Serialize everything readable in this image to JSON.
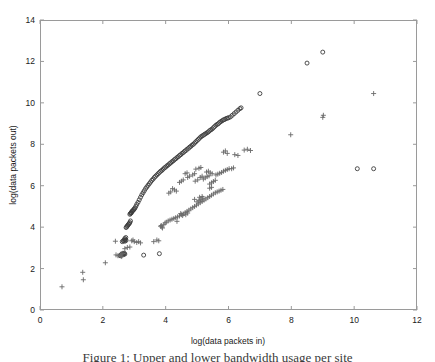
{
  "figure": {
    "caption_clipped": "Figure 1: Upper and lower bandwidth usage per site"
  },
  "chart_data": {
    "type": "scatter",
    "title": "",
    "xlabel": "log(data packets in)",
    "ylabel": "log(data packets out)",
    "xlim": [
      0,
      12
    ],
    "ylim": [
      0,
      14
    ],
    "xticks": [
      0,
      2,
      4,
      6,
      8,
      10,
      12
    ],
    "yticks": [
      0,
      2,
      4,
      6,
      8,
      10,
      12,
      14
    ],
    "grid": false,
    "legend": "none",
    "box": true,
    "tick_direction": "in",
    "axis_color": "#9a9a9a",
    "series": [
      {
        "name": "circles",
        "marker": "circle",
        "color": "#3c3c3c",
        "size": 4.0,
        "filled": false,
        "points": [
          [
            2.55,
            2.62
          ],
          [
            2.58,
            2.66
          ],
          [
            2.6,
            2.7
          ],
          [
            2.62,
            2.65
          ],
          [
            2.64,
            2.72
          ],
          [
            2.66,
            2.68
          ],
          [
            2.68,
            2.74
          ],
          [
            2.7,
            2.7
          ],
          [
            2.62,
            3.3
          ],
          [
            2.65,
            3.34
          ],
          [
            2.68,
            3.38
          ],
          [
            2.7,
            3.32
          ],
          [
            2.72,
            3.4
          ],
          [
            2.74,
            3.36
          ],
          [
            2.7,
            3.45
          ],
          [
            2.73,
            3.5
          ],
          [
            2.76,
            4.02
          ],
          [
            2.78,
            4.06
          ],
          [
            2.8,
            4.1
          ],
          [
            2.74,
            3.98
          ],
          [
            2.82,
            4.14
          ],
          [
            2.84,
            4.18
          ],
          [
            2.86,
            4.22
          ],
          [
            2.88,
            4.3
          ],
          [
            2.86,
            4.62
          ],
          [
            2.88,
            4.66
          ],
          [
            2.9,
            4.7
          ],
          [
            2.92,
            4.74
          ],
          [
            2.94,
            4.78
          ],
          [
            2.9,
            4.68
          ],
          [
            2.96,
            4.8
          ],
          [
            2.98,
            4.84
          ],
          [
            3.0,
            4.88
          ],
          [
            3.02,
            4.92
          ],
          [
            3.05,
            5.0
          ],
          [
            3.08,
            5.1
          ],
          [
            3.12,
            5.2
          ],
          [
            3.16,
            5.32
          ],
          [
            3.2,
            5.44
          ],
          [
            3.24,
            5.56
          ],
          [
            3.28,
            5.66
          ],
          [
            3.32,
            5.76
          ],
          [
            3.36,
            5.86
          ],
          [
            3.4,
            5.94
          ],
          [
            3.44,
            6.02
          ],
          [
            3.48,
            6.1
          ],
          [
            3.52,
            6.18
          ],
          [
            3.56,
            6.26
          ],
          [
            3.6,
            6.32
          ],
          [
            3.64,
            6.4
          ],
          [
            3.68,
            6.46
          ],
          [
            3.72,
            6.52
          ],
          [
            3.76,
            6.58
          ],
          [
            3.8,
            6.64
          ],
          [
            3.84,
            6.7
          ],
          [
            3.88,
            6.74
          ],
          [
            3.92,
            6.8
          ],
          [
            3.96,
            6.86
          ],
          [
            4.0,
            6.9
          ],
          [
            4.04,
            6.96
          ],
          [
            4.08,
            7.0
          ],
          [
            4.12,
            7.06
          ],
          [
            4.16,
            7.1
          ],
          [
            4.2,
            7.16
          ],
          [
            4.24,
            7.2
          ],
          [
            4.28,
            7.26
          ],
          [
            4.32,
            7.3
          ],
          [
            4.36,
            7.36
          ],
          [
            4.4,
            7.4
          ],
          [
            4.44,
            7.46
          ],
          [
            4.48,
            7.5
          ],
          [
            4.52,
            7.56
          ],
          [
            4.56,
            7.6
          ],
          [
            4.6,
            7.66
          ],
          [
            4.64,
            7.7
          ],
          [
            4.68,
            7.76
          ],
          [
            4.72,
            7.8
          ],
          [
            4.76,
            7.86
          ],
          [
            4.8,
            7.9
          ],
          [
            4.84,
            7.96
          ],
          [
            4.88,
            8.0
          ],
          [
            4.92,
            8.06
          ],
          [
            4.96,
            8.12
          ],
          [
            5.0,
            8.18
          ],
          [
            5.04,
            8.24
          ],
          [
            5.08,
            8.3
          ],
          [
            5.12,
            8.36
          ],
          [
            5.16,
            8.4
          ],
          [
            5.2,
            8.44
          ],
          [
            5.24,
            8.48
          ],
          [
            5.28,
            8.52
          ],
          [
            5.32,
            8.56
          ],
          [
            5.36,
            8.6
          ],
          [
            5.4,
            8.66
          ],
          [
            5.44,
            8.7
          ],
          [
            5.48,
            8.74
          ],
          [
            5.52,
            8.8
          ],
          [
            5.56,
            8.86
          ],
          [
            5.6,
            8.92
          ],
          [
            5.64,
            8.96
          ],
          [
            5.68,
            9.0
          ],
          [
            5.72,
            9.06
          ],
          [
            5.76,
            9.1
          ],
          [
            5.8,
            9.14
          ],
          [
            5.84,
            9.18
          ],
          [
            5.88,
            9.2
          ],
          [
            5.92,
            9.24
          ],
          [
            5.96,
            9.26
          ],
          [
            6.0,
            9.28
          ],
          [
            6.06,
            9.32
          ],
          [
            6.12,
            9.4
          ],
          [
            6.18,
            9.48
          ],
          [
            6.24,
            9.56
          ],
          [
            6.3,
            9.64
          ],
          [
            6.36,
            9.72
          ],
          [
            6.4,
            9.76
          ],
          [
            3.3,
            2.65
          ],
          [
            3.8,
            2.72
          ],
          [
            7.0,
            10.45
          ],
          [
            8.5,
            11.92
          ],
          [
            9.0,
            12.45
          ],
          [
            10.1,
            6.82
          ],
          [
            10.62,
            6.82
          ]
        ]
      },
      {
        "name": "pluses",
        "marker": "plus",
        "color": "#6a6a6a",
        "size": 5.0,
        "points": [
          [
            0.7,
            1.12
          ],
          [
            1.38,
            1.46
          ],
          [
            1.36,
            1.82
          ],
          [
            2.08,
            2.28
          ],
          [
            2.4,
            3.32
          ],
          [
            2.56,
            2.62
          ],
          [
            2.6,
            2.58
          ],
          [
            2.7,
            2.96
          ],
          [
            2.78,
            3.02
          ],
          [
            2.86,
            3.04
          ],
          [
            2.58,
            2.7
          ],
          [
            2.64,
            2.74
          ],
          [
            3.0,
            3.3
          ],
          [
            3.08,
            3.26
          ],
          [
            3.14,
            3.3
          ],
          [
            3.2,
            3.24
          ],
          [
            2.42,
            2.66
          ],
          [
            2.48,
            2.62
          ],
          [
            3.84,
            4.04
          ],
          [
            3.9,
            3.96
          ],
          [
            3.94,
            4.12
          ],
          [
            3.98,
            4.2
          ],
          [
            4.02,
            4.24
          ],
          [
            4.08,
            4.3
          ],
          [
            4.14,
            4.34
          ],
          [
            4.2,
            4.38
          ],
          [
            4.26,
            4.42
          ],
          [
            4.32,
            4.46
          ],
          [
            4.38,
            4.5
          ],
          [
            4.44,
            4.54
          ],
          [
            4.5,
            4.6
          ],
          [
            4.56,
            4.64
          ],
          [
            4.62,
            4.7
          ],
          [
            4.68,
            4.76
          ],
          [
            4.74,
            4.82
          ],
          [
            4.8,
            4.88
          ],
          [
            4.86,
            4.94
          ],
          [
            4.92,
            5.0
          ],
          [
            4.98,
            5.06
          ],
          [
            5.04,
            5.12
          ],
          [
            5.1,
            5.18
          ],
          [
            5.16,
            5.24
          ],
          [
            5.22,
            5.3
          ],
          [
            5.28,
            5.36
          ],
          [
            5.34,
            5.42
          ],
          [
            5.4,
            5.48
          ],
          [
            5.46,
            5.54
          ],
          [
            5.52,
            5.6
          ],
          [
            5.58,
            5.66
          ],
          [
            5.64,
            5.7
          ],
          [
            5.7,
            5.74
          ],
          [
            5.76,
            5.78
          ],
          [
            5.82,
            5.82
          ],
          [
            5.4,
            5.88
          ],
          [
            5.46,
            5.92
          ],
          [
            4.48,
            4.66
          ],
          [
            4.54,
            4.56
          ],
          [
            4.64,
            4.6
          ],
          [
            4.7,
            4.68
          ],
          [
            5.0,
            5.22
          ],
          [
            5.06,
            5.28
          ],
          [
            5.12,
            5.34
          ],
          [
            5.18,
            5.4
          ],
          [
            4.36,
            4.28
          ],
          [
            4.92,
            5.34
          ],
          [
            5.08,
            5.44
          ],
          [
            5.16,
            5.48
          ],
          [
            5.4,
            6.08
          ],
          [
            5.46,
            6.14
          ],
          [
            5.52,
            6.2
          ],
          [
            5.58,
            6.26
          ],
          [
            5.2,
            6.32
          ],
          [
            5.26,
            6.38
          ],
          [
            5.32,
            6.44
          ],
          [
            5.38,
            6.48
          ],
          [
            5.6,
            6.52
          ],
          [
            5.66,
            6.56
          ],
          [
            5.72,
            6.6
          ],
          [
            5.78,
            6.64
          ],
          [
            5.84,
            6.7
          ],
          [
            5.9,
            6.74
          ],
          [
            5.96,
            6.78
          ],
          [
            6.02,
            6.82
          ],
          [
            5.1,
            6.4
          ],
          [
            5.16,
            6.46
          ],
          [
            5.02,
            6.28
          ],
          [
            4.94,
            6.22
          ],
          [
            5.3,
            6.66
          ],
          [
            5.36,
            6.7
          ],
          [
            5.42,
            6.62
          ],
          [
            5.48,
            6.58
          ],
          [
            4.86,
            6.52
          ],
          [
            4.92,
            6.58
          ],
          [
            4.76,
            6.46
          ],
          [
            4.7,
            6.4
          ],
          [
            5.06,
            6.84
          ],
          [
            5.12,
            6.88
          ],
          [
            4.96,
            6.8
          ],
          [
            4.62,
            6.58
          ],
          [
            4.68,
            6.62
          ],
          [
            4.22,
            5.86
          ],
          [
            4.28,
            5.8
          ],
          [
            4.34,
            5.74
          ],
          [
            4.5,
            6.22
          ],
          [
            4.56,
            6.28
          ],
          [
            4.44,
            6.16
          ],
          [
            4.1,
            5.64
          ],
          [
            4.16,
            5.7
          ],
          [
            4.7,
            7.76
          ],
          [
            4.7,
            7.74
          ],
          [
            5.84,
            7.62
          ],
          [
            5.9,
            7.68
          ],
          [
            5.96,
            7.56
          ],
          [
            6.2,
            7.5
          ],
          [
            6.3,
            7.46
          ],
          [
            6.5,
            7.72
          ],
          [
            6.6,
            7.76
          ],
          [
            6.7,
            7.7
          ],
          [
            6.1,
            6.82
          ],
          [
            6.16,
            6.86
          ],
          [
            7.98,
            8.46
          ],
          [
            9.0,
            9.3
          ],
          [
            9.02,
            9.4
          ],
          [
            10.62,
            10.45
          ],
          [
            3.72,
            3.38
          ],
          [
            3.78,
            3.34
          ],
          [
            3.62,
            3.3
          ],
          [
            2.92,
            3.34
          ],
          [
            2.96,
            3.38
          ],
          [
            3.88,
            4.0
          ],
          [
            3.86,
            4.08
          ]
        ]
      }
    ]
  },
  "axes": {
    "xtick_labels": [
      "0",
      "2",
      "4",
      "6",
      "8",
      "10",
      "12"
    ],
    "ytick_labels": [
      "0",
      "2",
      "4",
      "6",
      "8",
      "10",
      "12",
      "14"
    ]
  }
}
